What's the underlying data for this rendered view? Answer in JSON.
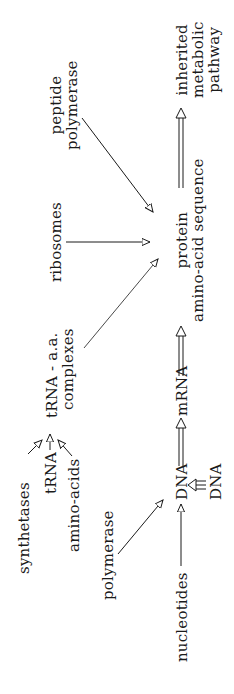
{
  "diagram": {
    "orientation": "rotated 90deg counter-clockwise",
    "nodes": {
      "synthetases": "synthetases",
      "trna": "tRNA",
      "amino_acids": "amino-acids",
      "trna_aa_complexes": [
        "tRNA - a.a.",
        "complexes"
      ],
      "ribosomes": "ribosomes",
      "peptide_polymerase": [
        "peptide",
        "polymerase"
      ],
      "polymerase": "polymerase",
      "nucleotides": "nucleotides",
      "dna": "DNA",
      "dna_template": "DNA",
      "mrna": "mRNA",
      "protein": [
        "protein",
        "amino-acid sequence"
      ],
      "inherited_pathway": [
        "inherited",
        "metabolic",
        "pathway"
      ]
    },
    "edges": [
      {
        "from": "synthetases",
        "to": "trna_aa_complexes",
        "style": "single"
      },
      {
        "from": "trna",
        "to": "trna_aa_complexes",
        "style": "single"
      },
      {
        "from": "amino_acids",
        "to": "trna_aa_complexes",
        "style": "single"
      },
      {
        "from": "trna_aa_complexes",
        "to": "protein",
        "style": "single"
      },
      {
        "from": "ribosomes",
        "to": "protein",
        "style": "single"
      },
      {
        "from": "peptide_polymerase",
        "to": "protein",
        "style": "single"
      },
      {
        "from": "polymerase",
        "to": "dna",
        "style": "single"
      },
      {
        "from": "nucleotides",
        "to": "dna",
        "style": "single"
      },
      {
        "from": "dna_template",
        "to": "dna",
        "style": "triple"
      },
      {
        "from": "dna",
        "to": "mrna",
        "style": "double"
      },
      {
        "from": "mrna",
        "to": "protein",
        "style": "double"
      },
      {
        "from": "protein",
        "to": "inherited_pathway",
        "style": "double"
      }
    ]
  }
}
